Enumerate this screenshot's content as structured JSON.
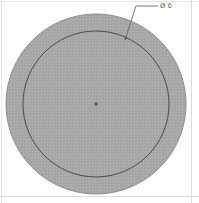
{
  "drawing": {
    "title": "Circular part orthographic view",
    "background_color": "#ffffff",
    "border": {
      "color": "#e3e3e3",
      "present": true
    },
    "shapes": {
      "outer_circle": {
        "name": "outer-circle",
        "center_x": 96,
        "center_y": 104,
        "radius": 90,
        "fill_color": "#a9a9a9",
        "stroke_color": "#8d8d8d",
        "stroke_width": 1
      },
      "inner_circle": {
        "name": "inner-circle",
        "center_x": 96,
        "center_y": 104,
        "radius": 73,
        "fill_color": "none",
        "stroke_color": "#4a4a4a",
        "stroke_width": 1
      },
      "center_mark": {
        "name": "center-mark",
        "x": 96,
        "y": 104,
        "size": 3,
        "color": "#555555"
      }
    },
    "leader": {
      "name": "leader-line",
      "color": "#6b6b6b",
      "stroke_width": 0.8,
      "horizontal_start_x": 147,
      "horizontal_end_x": 158,
      "horizontal_y": 6,
      "elbow_x": 136,
      "elbow_y": 6,
      "arrow_x": 125,
      "arrow_y": 40
    },
    "annotation": {
      "name": "diameter-callout",
      "symbol": "Ø",
      "value": "6",
      "text": "Ø 6",
      "color": "#5f5f5f",
      "x": 160,
      "y": 2
    }
  }
}
